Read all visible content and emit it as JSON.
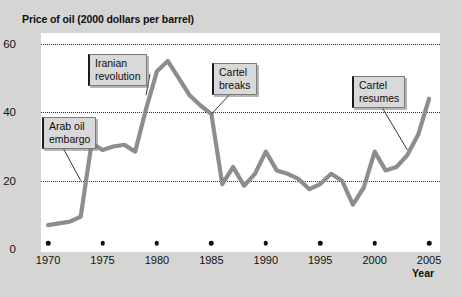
{
  "chart_data": {
    "type": "line",
    "title": "Price of oil (2000 dollars per barrel)",
    "xlabel": "Year",
    "ylabel": "",
    "xlim": [
      1969,
      2006
    ],
    "ylim": [
      0,
      62
    ],
    "grid": "horizontal dotted at 20, 40, 60",
    "legend": "none",
    "line_color": "#8d8d8d",
    "x": [
      1970,
      1971,
      1972,
      1973,
      1974,
      1975,
      1976,
      1977,
      1978,
      1979,
      1980,
      1981,
      1982,
      1983,
      1984,
      1985,
      1986,
      1987,
      1988,
      1989,
      1990,
      1991,
      1992,
      1993,
      1994,
      1995,
      1996,
      1997,
      1998,
      1999,
      2000,
      2001,
      2002,
      2003,
      2004,
      2005
    ],
    "values": [
      7,
      7.5,
      8,
      9.5,
      31,
      29,
      30,
      30.5,
      28.5,
      41,
      52,
      55,
      50,
      45,
      42,
      39.5,
      19,
      24,
      18.5,
      22,
      28.5,
      23,
      22,
      20.5,
      17.5,
      19,
      22,
      20,
      13,
      18,
      28.5,
      23,
      24,
      27.5,
      33.5,
      44
    ],
    "ytick_labels": [
      "0",
      "20",
      "40",
      "60"
    ],
    "ytick_values": [
      0,
      20,
      40,
      60
    ],
    "xtick_labels": [
      "1970",
      "1975",
      "1980",
      "1985",
      "1990",
      "1995",
      "2000",
      "2005"
    ],
    "xtick_values": [
      1970,
      1975,
      1980,
      1985,
      1990,
      1995,
      2000,
      2005
    ],
    "annotations": [
      {
        "label": "Arab oil\nembargo",
        "points_to_year": 1973,
        "points_to_value": 20
      },
      {
        "label": "Iranian\nrevolution",
        "points_to_year": 1979,
        "points_to_value": 45
      },
      {
        "label": "Cartel\nbreaks",
        "points_to_year": 1985,
        "points_to_value": 39.5
      },
      {
        "label": "Cartel\nresumes",
        "points_to_year": 2003,
        "points_to_value": 29
      }
    ]
  },
  "figure": {
    "title": "Price of oil (2000 dollars per barrel)",
    "axis_name": "Year"
  }
}
